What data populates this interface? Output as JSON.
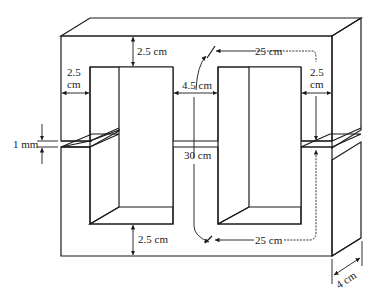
{
  "diagram": {
    "labels": {
      "top_yoke_thickness": "2.5 cm",
      "left_leg_width_line1": "2.5",
      "left_leg_width_line2": "cm",
      "center_leg_width": "4.5 cm",
      "top_path_length": "25 cm",
      "right_leg_width_line1": "2.5",
      "right_leg_width_line2": "cm",
      "air_gap": "1 mm",
      "center_path_length": "30 cm",
      "bottom_yoke_thickness": "2.5 cm",
      "bottom_path_length": "25 cm",
      "depth": "4 cm"
    },
    "colors": {
      "core_fill": "#d9d9d9",
      "core_top_fill": "#e4e4e4",
      "core_side_fill": "#cfcfcf",
      "inner_face_fill": "#c8c8c8",
      "window_fill": "#ffffff",
      "line": "#1a1a1a"
    }
  }
}
